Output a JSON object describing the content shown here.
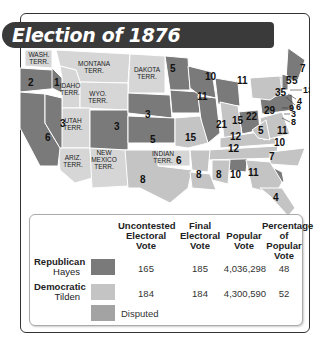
{
  "title": "Election of 1876",
  "colors": {
    "republican": "#7a7a7a",
    "democratic": "#c4c4c4",
    "disputed": "#a3a3a3",
    "territory": "#d6d6d6",
    "title_bar": "#3a3a3a"
  },
  "map": {
    "territories": [
      {
        "label": "WASH. TERR."
      },
      {
        "label": "MONTANA TERR."
      },
      {
        "label": "DAKOTA TERR."
      },
      {
        "label": "IDAHO TERR."
      },
      {
        "label": "WYO. TERR."
      },
      {
        "label": "UTAH TERR."
      },
      {
        "label": "ARIZ. TERR."
      },
      {
        "label": "NEW MEXICO TERR."
      },
      {
        "label": "INDIAN TERR."
      }
    ],
    "states": [
      {
        "name": "Oregon",
        "votes": "3"
      },
      {
        "name": "Washington-area",
        "votes": "2"
      },
      {
        "name": "Idaho-area",
        "votes": "1"
      },
      {
        "name": "California",
        "votes": "6"
      },
      {
        "name": "Nevada",
        "votes": "3"
      },
      {
        "name": "Colorado",
        "votes": "3"
      },
      {
        "name": "Nebraska",
        "votes": "3"
      },
      {
        "name": "Kansas",
        "votes": "5"
      },
      {
        "name": "Minnesota",
        "votes": "5"
      },
      {
        "name": "Iowa",
        "votes": "11"
      },
      {
        "name": "Wisconsin",
        "votes": "10"
      },
      {
        "name": "Michigan",
        "votes": "11"
      },
      {
        "name": "Illinois",
        "votes": "21"
      },
      {
        "name": "Missouri",
        "votes": "15"
      },
      {
        "name": "Indiana",
        "votes": "15"
      },
      {
        "name": "Ohio",
        "votes": "22"
      },
      {
        "name": "Pennsylvania",
        "votes": "29"
      },
      {
        "name": "New York",
        "votes": "35"
      },
      {
        "name": "Vermont",
        "votes": "5"
      },
      {
        "name": "New Hampshire",
        "votes": "5"
      },
      {
        "name": "Maine",
        "votes": "7"
      },
      {
        "name": "Massachusetts",
        "votes": "13"
      },
      {
        "name": "Rhode Island",
        "votes": "4"
      },
      {
        "name": "Connecticut",
        "votes": "6"
      },
      {
        "name": "New Jersey",
        "votes": "9"
      },
      {
        "name": "Delaware",
        "votes": "3"
      },
      {
        "name": "Maryland",
        "votes": "8"
      },
      {
        "name": "West Virginia",
        "votes": "5"
      },
      {
        "name": "Virginia",
        "votes": "11"
      },
      {
        "name": "Kentucky",
        "votes": "12"
      },
      {
        "name": "Tennessee",
        "votes": "12"
      },
      {
        "name": "North Carolina",
        "votes": "10"
      },
      {
        "name": "South Carolina",
        "votes": "7"
      },
      {
        "name": "Georgia",
        "votes": "11"
      },
      {
        "name": "Alabama",
        "votes": "10"
      },
      {
        "name": "Mississippi",
        "votes": "8"
      },
      {
        "name": "Louisiana",
        "votes": "8"
      },
      {
        "name": "Arkansas",
        "votes": "6"
      },
      {
        "name": "Texas",
        "votes": "8"
      },
      {
        "name": "Florida",
        "votes": "4"
      }
    ]
  },
  "legend": {
    "headers": {
      "uncontested": "Uncontested Electoral Vote",
      "final": "Final Electoral Vote",
      "popular": "Popular Vote",
      "percentage": "Percentage of Popular Vote"
    },
    "rows": [
      {
        "party": "Republican",
        "candidate": "Hayes",
        "uncontested": "165",
        "final": "185",
        "popular": "4,036,298",
        "percentage": "48"
      },
      {
        "party": "Democratic",
        "candidate": "Tilden",
        "uncontested": "184",
        "final": "184",
        "popular": "4,300,590",
        "percentage": "52"
      },
      {
        "party": "",
        "candidate": "",
        "uncontested": "Disputed",
        "final": "",
        "popular": "",
        "percentage": ""
      }
    ]
  }
}
